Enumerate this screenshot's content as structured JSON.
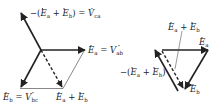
{
  "left_diagram": {
    "labels": {
      "vca": {
        "prefix": "−(",
        "e1": "E",
        "s1": "a",
        "plus": " + ",
        "e2": "E",
        "s2": "b",
        "mid": ") = ",
        "v": "V",
        "sv": "ca"
      },
      "vab": {
        "e": "E",
        "s": "a",
        "eq": " = ",
        "v": "V",
        "sv": "ab"
      },
      "vbc": {
        "e": "E",
        "s": "b",
        "eq": " = ",
        "v": "V",
        "sv": "bc"
      },
      "sum": {
        "e1": "E",
        "s1": "a",
        "plus": " + ",
        "e2": "E",
        "s2": "b"
      }
    }
  },
  "right_diagram": {
    "labels": {
      "sum": {
        "e1": "E",
        "s1": "a",
        "plus": " + ",
        "e2": "E",
        "s2": "b"
      },
      "ea": {
        "e": "E",
        "s": "a"
      },
      "eb": {
        "e": "E",
        "s": "b"
      },
      "neg": {
        "prefix": "−(",
        "e1": "E",
        "s1": "a",
        "plus": " + ",
        "e2": "E",
        "s2": "b",
        "suffix": ")"
      }
    }
  },
  "colors": {
    "stroke": "#222222",
    "thin": "#555555"
  }
}
